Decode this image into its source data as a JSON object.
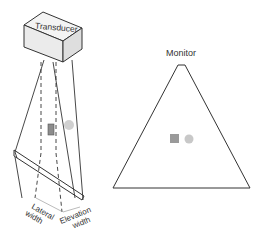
{
  "diagram": {
    "transducer": {
      "label": "Transducer"
    },
    "monitor": {
      "title": "Monitor"
    },
    "labels": {
      "lateral_line1": "Lateral",
      "lateral_line2": "width",
      "elevation_line1": "Elevation",
      "elevation_line2": "width"
    },
    "colors": {
      "line": "#333333",
      "box_fill": "#f0f0f0",
      "box_side": "#e2e2e2",
      "target_square": "#8c8c8c",
      "target_circle": "#c8c8c8",
      "arrow": "#aaaaaa"
    }
  }
}
